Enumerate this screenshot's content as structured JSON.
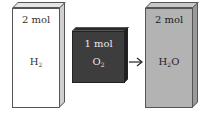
{
  "diagram": {
    "type": "reaction-stoichiometry",
    "arrow": "→",
    "boxes": [
      {
        "id": "h2",
        "amount": "2 mol",
        "formula_main": "H",
        "formula_sub": "2",
        "formula_tail": "",
        "front_color": "#ffffff",
        "top_color": "#e6e6e6",
        "side_color": "#cfcfcf",
        "text_color": "#333333"
      },
      {
        "id": "o2",
        "amount": "1 mol",
        "formula_main": "O",
        "formula_sub": "2",
        "formula_tail": "",
        "front_color": "#3d3d3d",
        "top_color": "#2a2a2a",
        "side_color": "#1f1f1f",
        "text_color": "#e8e8e8"
      },
      {
        "id": "h2o",
        "amount": "2 mol",
        "formula_main": "H",
        "formula_sub": "2",
        "formula_tail": "O",
        "front_color": "#b3b3b3",
        "top_color": "#c8c8c8",
        "side_color": "#9a9a9a",
        "text_color": "#222222"
      }
    ]
  }
}
